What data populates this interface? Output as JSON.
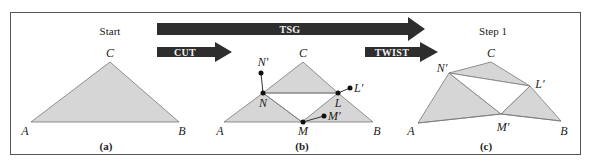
{
  "panels": {
    "a": {
      "title": "Start",
      "caption": "(a)",
      "labels": {
        "A": "A",
        "B": "B",
        "C": "C"
      }
    },
    "b": {
      "caption": "(b)",
      "labels": {
        "A": "A",
        "B": "B",
        "C": "C",
        "N": "N",
        "L": "L",
        "M": "M",
        "Nprime": "N′",
        "Lprime": "L′",
        "Mprime": "M′"
      }
    },
    "c": {
      "title": "Step 1",
      "caption": "(c)",
      "labels": {
        "A": "A",
        "B": "B",
        "C": "C",
        "Nprime": "N′",
        "Lprime": "L′",
        "Mprime": "M′"
      }
    }
  },
  "arrows": {
    "tsg": "TSG",
    "cut": "CUT",
    "twist": "TWIST"
  },
  "colors": {
    "triangle_fill": "#d6d6d6",
    "arrow_fill": "#2e2e2e",
    "stroke": "#555555"
  }
}
